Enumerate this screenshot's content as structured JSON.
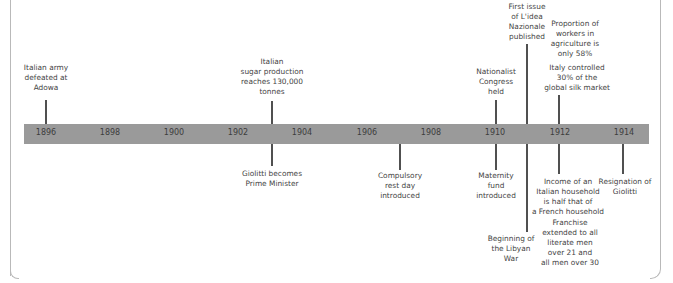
{
  "timeline": {
    "bar_color": "#9a9a9a",
    "line_color": "#505050",
    "years": [
      {
        "label": "1896",
        "x": 46
      },
      {
        "label": "1898",
        "x": 110
      },
      {
        "label": "1900",
        "x": 174
      },
      {
        "label": "1902",
        "x": 238
      },
      {
        "label": "1904",
        "x": 302
      },
      {
        "label": "1906",
        "x": 367
      },
      {
        "label": "1908",
        "x": 431
      },
      {
        "label": "1910",
        "x": 495
      },
      {
        "label": "1912",
        "x": 560
      },
      {
        "label": "1914",
        "x": 624
      }
    ],
    "events_above": [
      {
        "id": "adowa",
        "lines": [
          "Italian army",
          "defeated at",
          "Adowa"
        ]
      },
      {
        "id": "sugar",
        "lines": [
          "Italian",
          "sugar production",
          "reaches 130,000",
          "tonnes"
        ]
      },
      {
        "id": "nationalist",
        "lines": [
          "Nationalist",
          "Congress",
          "held"
        ]
      },
      {
        "id": "idea",
        "lines": [
          "First issue",
          "of L'idea",
          "Nazionale",
          "published"
        ]
      },
      {
        "id": "agri",
        "lines": [
          "Proportion of",
          "workers in",
          "agriculture is",
          "only 58%"
        ]
      },
      {
        "id": "silk",
        "lines": [
          "Italy controlled",
          "30% of the",
          "global silk market"
        ]
      }
    ],
    "events_below": [
      {
        "id": "giolitti-pm",
        "lines": [
          "Giolitti becomes",
          "Prime Minister"
        ]
      },
      {
        "id": "rest-day",
        "lines": [
          "Compulsory",
          "rest day",
          "introduced"
        ]
      },
      {
        "id": "maternity",
        "lines": [
          "Maternity",
          "fund",
          "introduced"
        ]
      },
      {
        "id": "libyan",
        "lines": [
          "Beginning of",
          "the Libyan",
          "War"
        ]
      },
      {
        "id": "income",
        "lines": [
          "Income of an",
          "Italian household",
          "is half that of",
          "a French household"
        ]
      },
      {
        "id": "franchise",
        "lines": [
          "Franchise",
          "extended to all",
          "literate men",
          "over 21 and",
          "all men over 30"
        ]
      },
      {
        "id": "resignation",
        "lines": [
          "Resignation of",
          "Giolitti"
        ]
      }
    ]
  }
}
